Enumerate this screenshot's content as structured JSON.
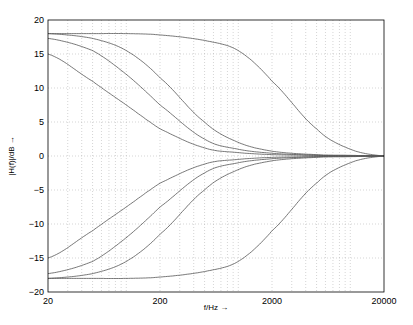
{
  "chart_data": {
    "type": "line",
    "title": "",
    "xlabel": "f/Hz →",
    "ylabel": "|H(f)|/dB →",
    "xscale": "log",
    "xlim": [
      20,
      20000
    ],
    "ylim": [
      -20,
      20
    ],
    "grid": true,
    "legend": "none",
    "x_ticks": [
      20,
      200,
      2000,
      20000
    ],
    "x_tick_labels": [
      "20",
      "200",
      "2000",
      "20000"
    ],
    "y_ticks": [
      -20,
      -15,
      -10,
      -5,
      0,
      5,
      10,
      15,
      20
    ],
    "y_tick_labels": [
      "−20",
      "−15",
      "−10",
      "−5",
      "0",
      "5",
      "10",
      "15",
      "20"
    ],
    "x": [
      20,
      50,
      100,
      200,
      500,
      1000,
      2000,
      5000,
      10000,
      20000
    ],
    "series": [
      {
        "name": "boost-high-fc",
        "values": [
          18,
          18,
          18,
          17.8,
          17,
          15.5,
          11,
          4,
          1,
          0
        ]
      },
      {
        "name": "boost-fc-3",
        "values": [
          18,
          17.3,
          15.5,
          11.5,
          5,
          2,
          0.7,
          0.2,
          0.1,
          0
        ]
      },
      {
        "name": "boost-fc-2",
        "values": [
          17.3,
          15.5,
          12,
          7.5,
          2.5,
          1,
          0.4,
          0.1,
          0,
          0
        ]
      },
      {
        "name": "boost-fc-1",
        "values": [
          15,
          11,
          7.5,
          4,
          1.2,
          0.5,
          0.2,
          0.1,
          0,
          0
        ]
      },
      {
        "name": "cut-fc-1",
        "values": [
          -15,
          -11,
          -7.5,
          -4,
          -1.2,
          -0.5,
          -0.2,
          -0.1,
          0,
          0
        ]
      },
      {
        "name": "cut-fc-2",
        "values": [
          -17.3,
          -15.5,
          -12,
          -7.5,
          -2.5,
          -1,
          -0.4,
          -0.1,
          0,
          0
        ]
      },
      {
        "name": "cut-fc-3",
        "values": [
          -18,
          -17.3,
          -15.5,
          -11.5,
          -5,
          -2,
          -0.7,
          -0.2,
          -0.1,
          0
        ]
      },
      {
        "name": "cut-high-fc",
        "values": [
          -18,
          -18,
          -18,
          -17.8,
          -17,
          -15.5,
          -11,
          -4,
          -1,
          0
        ]
      }
    ]
  }
}
